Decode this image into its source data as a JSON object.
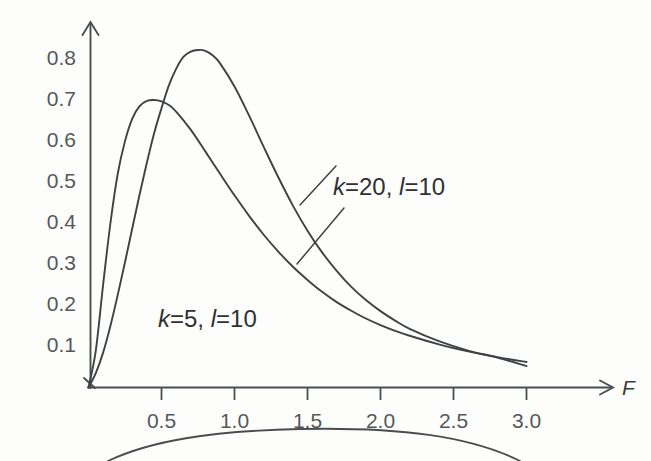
{
  "chart_data": {
    "type": "line",
    "title": "",
    "xlabel": "F",
    "ylabel": "",
    "xlim": [
      0,
      3.18
    ],
    "ylim": [
      0,
      0.88
    ],
    "grid": false,
    "legend_position": "inline-annotations",
    "x_ticks": [
      "0.5",
      "1.0",
      "1.5",
      "2.0",
      "2.5",
      "3.0"
    ],
    "x_tick_values": [
      0.5,
      1.0,
      1.5,
      2.0,
      2.5,
      3.0
    ],
    "y_ticks": [
      "0.1",
      "0.2",
      "0.3",
      "0.4",
      "0.5",
      "0.6",
      "0.7",
      "0.8"
    ],
    "y_tick_values": [
      0.1,
      0.2,
      0.3,
      0.4,
      0.5,
      0.6,
      0.7,
      0.8
    ],
    "annotations": [
      {
        "name": "curve-label-k20",
        "text": "k=20,  l=10",
        "k": 20,
        "l": 10,
        "x": 1.55,
        "y": 0.535
      },
      {
        "name": "curve-label-k5",
        "text": "k=5,  l=10",
        "k": 5,
        "l": 10,
        "x": 0.72,
        "y": 0.185
      }
    ],
    "series": [
      {
        "name": "k=5, l=10",
        "peak_x": 0.49,
        "peak_y": 0.7,
        "x": [
          0.0,
          0.05,
          0.1,
          0.15,
          0.2,
          0.25,
          0.3,
          0.35,
          0.4,
          0.45,
          0.5,
          0.55,
          0.6,
          0.7,
          0.8,
          0.9,
          1.0,
          1.1,
          1.2,
          1.3,
          1.4,
          1.5,
          1.6,
          1.7,
          1.8,
          1.9,
          2.0,
          2.1,
          2.2,
          2.4,
          2.6,
          2.8,
          3.0
        ],
        "values": [
          0.0,
          0.09,
          0.25,
          0.4,
          0.52,
          0.6,
          0.655,
          0.685,
          0.698,
          0.7,
          0.697,
          0.688,
          0.672,
          0.628,
          0.575,
          0.521,
          0.468,
          0.418,
          0.372,
          0.331,
          0.294,
          0.262,
          0.233,
          0.208,
          0.187,
          0.168,
          0.152,
          0.138,
          0.126,
          0.105,
          0.088,
          0.074,
          0.062
        ]
      },
      {
        "name": "k=20, l=10",
        "peak_x": 0.79,
        "peak_y": 0.82,
        "x": [
          0.0,
          0.05,
          0.1,
          0.15,
          0.2,
          0.25,
          0.3,
          0.35,
          0.4,
          0.45,
          0.5,
          0.55,
          0.6,
          0.65,
          0.7,
          0.75,
          0.8,
          0.85,
          0.9,
          1.0,
          1.1,
          1.2,
          1.3,
          1.4,
          1.5,
          1.6,
          1.7,
          1.8,
          1.9,
          2.0,
          2.1,
          2.2,
          2.4,
          2.6,
          2.8,
          3.0
        ],
        "values": [
          0.0,
          0.035,
          0.085,
          0.15,
          0.225,
          0.305,
          0.388,
          0.47,
          0.548,
          0.62,
          0.68,
          0.735,
          0.776,
          0.805,
          0.818,
          0.822,
          0.82,
          0.809,
          0.79,
          0.733,
          0.662,
          0.586,
          0.512,
          0.443,
          0.382,
          0.329,
          0.284,
          0.245,
          0.213,
          0.186,
          0.163,
          0.143,
          0.113,
          0.09,
          0.073,
          0.052
        ]
      }
    ]
  },
  "axes": {
    "y_axis_name": "",
    "x_axis_name": "F"
  },
  "colors": {
    "background": "#fdfdfc",
    "axis": "#4b4e50",
    "curve": "#3f4244",
    "tick_label": "#55585a",
    "annotation": "#2e3133"
  }
}
